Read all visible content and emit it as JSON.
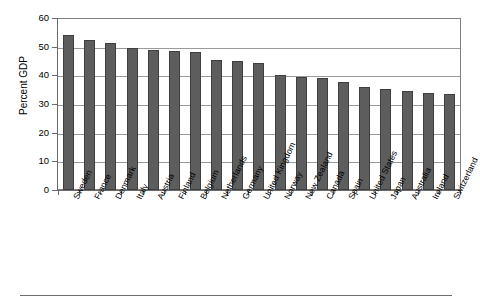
{
  "chart_data": {
    "type": "bar",
    "title": "",
    "subtitle": "",
    "xlabel": "",
    "ylabel": "Percent GDP",
    "ylim": [
      0,
      60
    ],
    "ytick_interval": 10,
    "yticks": [
      0,
      10,
      20,
      30,
      40,
      50,
      60
    ],
    "ytick_labels": [
      "0",
      "10",
      "20",
      "30",
      "40",
      "50",
      "60"
    ],
    "grid": "horizontal",
    "legend": "none",
    "bar_color": "#5d5d5d",
    "bar_edge_color": "#3f3f3f",
    "gridline_color": "#9a9a9a",
    "axis_color": "#6b6b6b",
    "categories": [
      "Sweden",
      "France",
      "Denmark",
      "Italy",
      "Austria",
      "Finland",
      "Belgium",
      "Netherlands",
      "Germany",
      "United Kingdom",
      "Norway",
      "New Zealand",
      "Canada",
      "Spain",
      "United States",
      "Japan",
      "Australia",
      "Ireland",
      "Switzerland"
    ],
    "values": [
      54.3,
      52.5,
      51.5,
      49.9,
      49.3,
      48.7,
      48.5,
      45.5,
      45.3,
      44.6,
      40.3,
      39.5,
      39.4,
      38.0,
      36.2,
      35.6,
      34.7,
      34.2,
      33.6
    ]
  }
}
